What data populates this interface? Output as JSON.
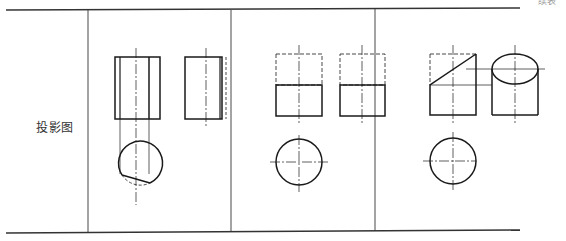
{
  "table": {
    "row_label": "投影图",
    "corner_text": "续表",
    "columns": [
      {
        "id": "label-col",
        "x_start": 6,
        "x_end": 88
      },
      {
        "id": "case-1",
        "x_start": 88,
        "x_end": 231,
        "description": "cylinder cut by plane parallel to axis"
      },
      {
        "id": "case-2",
        "x_start": 231,
        "x_end": 375,
        "description": "cylinder cut by plane perpendicular to axis"
      },
      {
        "id": "case-3",
        "x_start": 375,
        "x_end": 520,
        "description": "cylinder cut by plane inclined to axis"
      }
    ]
  },
  "colors": {
    "line": "#1a1a1a",
    "rule": "#333333",
    "text": "#333333"
  }
}
